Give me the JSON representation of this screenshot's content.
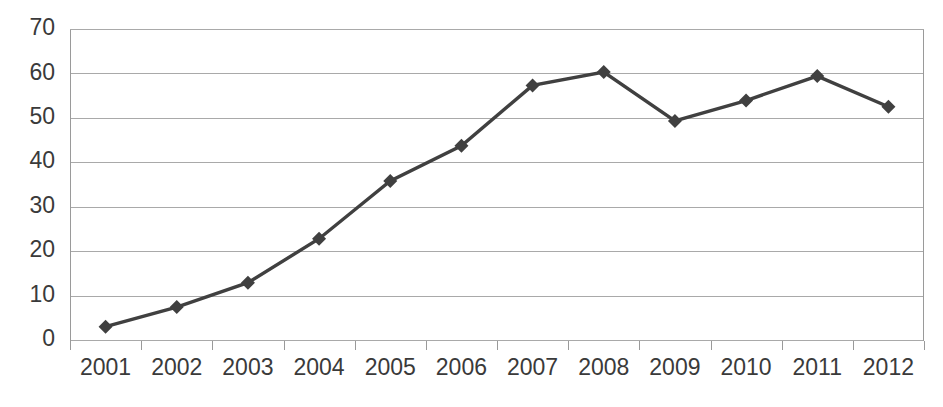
{
  "chart_data": {
    "type": "line",
    "title": "",
    "subtitle": "",
    "xlabel": "",
    "ylabel": "",
    "categories": [
      "2001",
      "2002",
      "2003",
      "2004",
      "2005",
      "2006",
      "2007",
      "2008",
      "2009",
      "2010",
      "2011",
      "2012"
    ],
    "series": [
      {
        "name": "Series 1",
        "values": [
          3.0,
          7.4,
          12.9,
          22.8,
          35.8,
          43.7,
          57.3,
          60.3,
          49.3,
          53.9,
          59.4,
          52.5
        ],
        "color": "#404040",
        "marker": "diamond"
      }
    ],
    "ylim": [
      0,
      70
    ],
    "yticks": [
      0,
      10,
      20,
      30,
      40,
      50,
      60,
      70
    ],
    "ytick_labels": [
      "0",
      "10",
      "20",
      "30",
      "40",
      "50",
      "60",
      "70"
    ],
    "xtick_labels": [
      "2001",
      "2002",
      "2003",
      "2004",
      "2005",
      "2006",
      "2007",
      "2008",
      "2009",
      "2010",
      "2011",
      "2012"
    ],
    "grid": {
      "horizontal": true,
      "vertical": false,
      "color": "#a9a9a9"
    },
    "legend": {
      "visible": false,
      "position": "none",
      "entries": []
    },
    "annotations": [],
    "axis_colors": {
      "axis": "#9a9a9a",
      "tick_text": "#3a3a3a"
    }
  },
  "layout": {
    "plot_left": 70,
    "plot_right": 924,
    "plot_top": 29,
    "plot_bottom": 340,
    "width": 943,
    "height": 407
  }
}
